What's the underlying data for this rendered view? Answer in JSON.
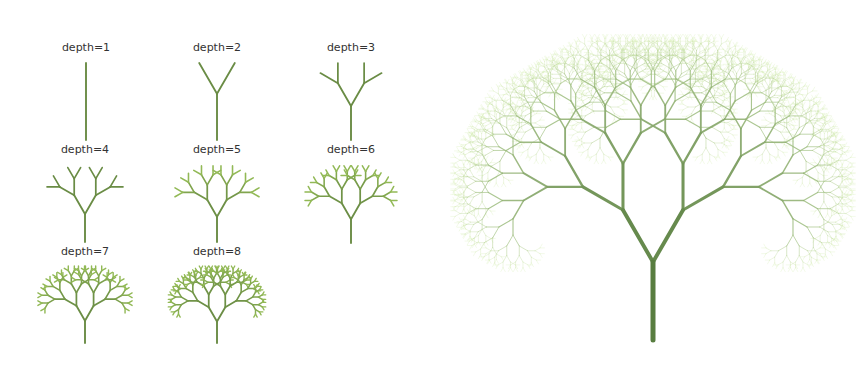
{
  "figure": {
    "background": "#ffffff",
    "branch_angle_deg": 30,
    "length_ratio": 0.77,
    "colors": {
      "trunk": "#587d40",
      "small_tree": "#6a8c45",
      "small_tip": "#9cc45a",
      "big_tip": "#d2ebb0",
      "label_text": "#333333"
    }
  },
  "small_trees": [
    {
      "label": "depth=1",
      "depth": 1,
      "cx": 86,
      "label_y": 41,
      "base_y": 140,
      "height": 77,
      "max_width": 80
    },
    {
      "label": "depth=2",
      "depth": 2,
      "cx": 217,
      "label_y": 41,
      "base_y": 140,
      "height": 77,
      "max_width": 80
    },
    {
      "label": "depth=3",
      "depth": 3,
      "cx": 351,
      "label_y": 41,
      "base_y": 140,
      "height": 77,
      "max_width": 80
    },
    {
      "label": "depth=4",
      "depth": 4,
      "cx": 85,
      "label_y": 143,
      "base_y": 242,
      "height": 77,
      "max_width": 76
    },
    {
      "label": "depth=5",
      "depth": 5,
      "cx": 217,
      "label_y": 143,
      "base_y": 242,
      "height": 77,
      "max_width": 84
    },
    {
      "label": "depth=6",
      "depth": 6,
      "cx": 351,
      "label_y": 143,
      "base_y": 243,
      "height": 78,
      "max_width": 92
    },
    {
      "label": "depth=7",
      "depth": 7,
      "cx": 85,
      "label_y": 245,
      "base_y": 343,
      "height": 77,
      "max_width": 98
    },
    {
      "label": "depth=8",
      "depth": 8,
      "cx": 217,
      "label_y": 245,
      "base_y": 343,
      "height": 77,
      "max_width": 102
    }
  ],
  "big_tree": {
    "depth": 12,
    "base_x": 653,
    "base_y": 340,
    "trunk_length": 78,
    "trunk_width": 5
  }
}
